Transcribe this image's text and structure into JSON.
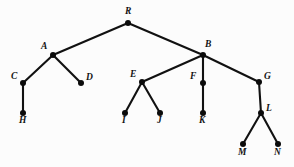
{
  "figure": {
    "type": "rooted-tree-diagram",
    "background_color": "#fcfcfc",
    "node_color": "#0b0b0b",
    "edge_color": "#111111",
    "width": 294,
    "height": 167
  },
  "chart_data": {
    "type": "diagram",
    "title": "",
    "nodes": [
      {
        "id": "R",
        "label": "R",
        "x": 128,
        "y": 23,
        "label_x": 125,
        "label_y": 7,
        "level": 0
      },
      {
        "id": "A",
        "label": "A",
        "x": 53,
        "y": 55,
        "label_x": 41,
        "label_y": 42,
        "level": 1
      },
      {
        "id": "B",
        "label": "B",
        "x": 203,
        "y": 55,
        "label_x": 205,
        "label_y": 40,
        "level": 1
      },
      {
        "id": "C",
        "label": "C",
        "x": 23,
        "y": 83,
        "label_x": 11,
        "label_y": 72,
        "level": 2
      },
      {
        "id": "D",
        "label": "D",
        "x": 81,
        "y": 83,
        "label_x": 86,
        "label_y": 73,
        "level": 2
      },
      {
        "id": "E",
        "label": "E",
        "x": 142,
        "y": 82,
        "label_x": 130,
        "label_y": 70,
        "level": 2
      },
      {
        "id": "F",
        "label": "F",
        "x": 203,
        "y": 83,
        "label_x": 190,
        "label_y": 72,
        "level": 2
      },
      {
        "id": "G",
        "label": "G",
        "x": 259,
        "y": 82,
        "label_x": 264,
        "label_y": 72,
        "level": 2
      },
      {
        "id": "H",
        "label": "H",
        "x": 23,
        "y": 113,
        "label_x": 19,
        "label_y": 116,
        "level": 3
      },
      {
        "id": "I",
        "label": "I",
        "x": 125,
        "y": 113,
        "label_x": 122,
        "label_y": 116,
        "level": 3
      },
      {
        "id": "J",
        "label": "J",
        "x": 160,
        "y": 113,
        "label_x": 157,
        "label_y": 116,
        "level": 3
      },
      {
        "id": "K",
        "label": "K",
        "x": 203,
        "y": 113,
        "label_x": 199,
        "label_y": 116,
        "level": 3
      },
      {
        "id": "L",
        "label": "L",
        "x": 261,
        "y": 113,
        "label_x": 266,
        "label_y": 104,
        "level": 3
      },
      {
        "id": "M",
        "label": "M",
        "x": 243,
        "y": 144,
        "label_x": 238,
        "label_y": 148,
        "level": 4
      },
      {
        "id": "N",
        "label": "N",
        "x": 278,
        "y": 144,
        "label_x": 274,
        "label_y": 148,
        "level": 4
      }
    ],
    "edges": [
      {
        "from": "R",
        "to": "A"
      },
      {
        "from": "R",
        "to": "B"
      },
      {
        "from": "A",
        "to": "C"
      },
      {
        "from": "A",
        "to": "D"
      },
      {
        "from": "C",
        "to": "H"
      },
      {
        "from": "B",
        "to": "E"
      },
      {
        "from": "B",
        "to": "F"
      },
      {
        "from": "B",
        "to": "G"
      },
      {
        "from": "E",
        "to": "I"
      },
      {
        "from": "E",
        "to": "J"
      },
      {
        "from": "F",
        "to": "K"
      },
      {
        "from": "G",
        "to": "L"
      },
      {
        "from": "L",
        "to": "M"
      },
      {
        "from": "L",
        "to": "N"
      }
    ],
    "root": "R",
    "node_radius": 3.0
  }
}
